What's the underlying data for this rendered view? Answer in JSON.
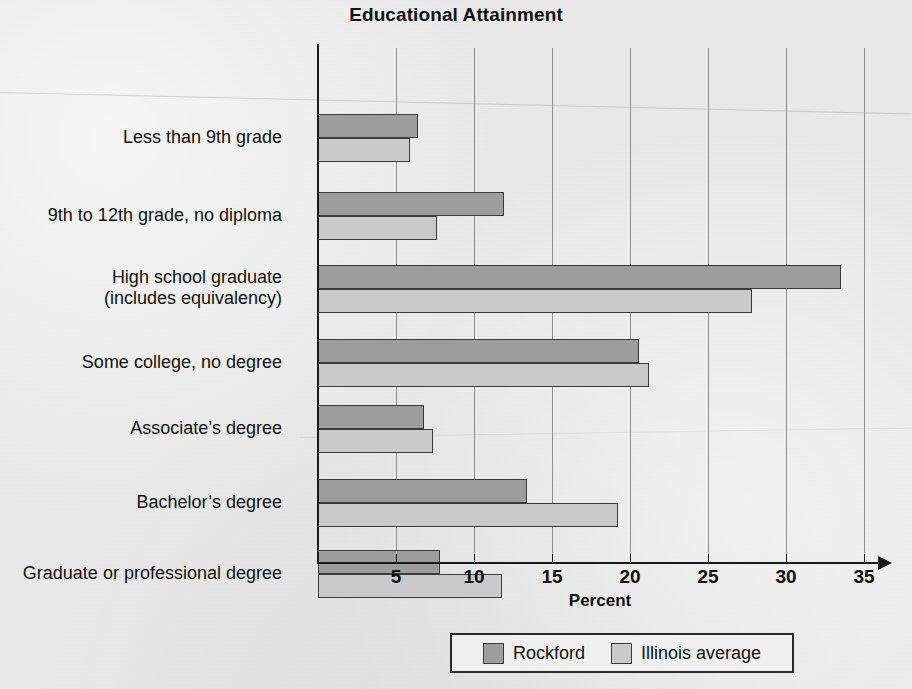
{
  "chart_data": {
    "type": "bar",
    "orientation": "horizontal",
    "title": "Educational Attainment",
    "xlabel": "Percent",
    "ylabel": "",
    "xlim": [
      0,
      36.5
    ],
    "xticks": [
      5,
      10,
      15,
      20,
      25,
      30,
      35
    ],
    "grid": true,
    "legend_position": "bottom",
    "categories": [
      "Less than 9th grade",
      "9th to 12th grade, no diploma",
      "High school graduate\n(includes equivalency)",
      "Some college, no degree",
      "Associate's degree",
      "Bachelor's degree",
      "Graduate or professional degree"
    ],
    "series": [
      {
        "name": "Rockford",
        "color": "#9c9c9c",
        "values": [
          6.4,
          11.9,
          33.5,
          20.6,
          6.8,
          13.4,
          7.8
        ]
      },
      {
        "name": "Illinois average",
        "color": "#cacaca",
        "values": [
          5.9,
          7.6,
          27.8,
          21.2,
          7.4,
          19.2,
          11.8
        ]
      }
    ]
  },
  "axis": {
    "tick_labels": [
      "5",
      "10",
      "15",
      "20",
      "25",
      "30",
      "35"
    ],
    "x_title": "Percent"
  },
  "categories_display": [
    {
      "line1": "Less than 9th grade",
      "line2": ""
    },
    {
      "line1": "9th to 12th grade, no diploma",
      "line2": ""
    },
    {
      "line1": "High school graduate",
      "line2": "(includes equivalency)"
    },
    {
      "line1": "Some college, no degree",
      "line2": ""
    },
    {
      "line1": "Associate’s degree",
      "line2": ""
    },
    {
      "line1": "Bachelor’s degree",
      "line2": ""
    },
    {
      "line1": "Graduate or professional degree",
      "line2": ""
    }
  ],
  "legend": {
    "entries": [
      {
        "label": "Rockford",
        "color": "#9c9c9c"
      },
      {
        "label": "Illinois average",
        "color": "#cacaca"
      }
    ]
  },
  "layout": {
    "origin_x": 318,
    "px_per_unit": 15.6,
    "plot_top": 48,
    "plot_bottom": 562,
    "bar_height": 24,
    "group_centers": [
      90,
      168,
      241,
      315,
      381,
      455,
      526
    ]
  }
}
